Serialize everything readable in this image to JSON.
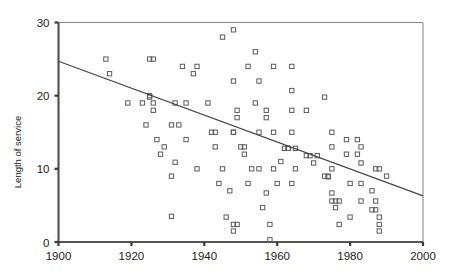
{
  "chart_data": {
    "type": "scatter",
    "title": "",
    "subtitle": "",
    "xlabel": "",
    "ylabel": "Length of service",
    "xlim": [
      1900,
      2000
    ],
    "ylim": [
      0,
      30
    ],
    "xticks": [
      1900,
      1920,
      1940,
      1960,
      1980,
      2000
    ],
    "yticks": [
      0,
      10,
      20,
      30
    ],
    "xtick_labels": [
      "1900",
      "1920",
      "1940",
      "1960",
      "1980",
      "2000"
    ],
    "ytick_labels": [
      "0",
      "10",
      "20",
      "30"
    ],
    "grid": false,
    "legend": null,
    "marker": "open-square",
    "marker_color": "#5b5b5b",
    "series": [
      {
        "name": "Length of service",
        "points": [
          [
            1913,
            25.0
          ],
          [
            1914,
            23.0
          ],
          [
            1919,
            19.0
          ],
          [
            1923,
            19.0
          ],
          [
            1924,
            16.0
          ],
          [
            1925,
            25.0
          ],
          [
            1926,
            25.0
          ],
          [
            1925,
            20.0
          ],
          [
            1925,
            19.8
          ],
          [
            1926,
            19.0
          ],
          [
            1926,
            18.0
          ],
          [
            1927,
            14.0
          ],
          [
            1929,
            13.0
          ],
          [
            1928,
            12.0
          ],
          [
            1931,
            16.0
          ],
          [
            1931,
            9.0
          ],
          [
            1931,
            3.5
          ],
          [
            1932,
            19.0
          ],
          [
            1932,
            10.9
          ],
          [
            1933,
            16.0
          ],
          [
            1934,
            24.0
          ],
          [
            1935,
            19.0
          ],
          [
            1935,
            14.0
          ],
          [
            1937,
            23.0
          ],
          [
            1938,
            24.0
          ],
          [
            1938,
            10.0
          ],
          [
            1941,
            19.0
          ],
          [
            1942,
            15.0
          ],
          [
            1943,
            15.0
          ],
          [
            1943,
            13.0
          ],
          [
            1944,
            8.0
          ],
          [
            1945,
            28.0
          ],
          [
            1945,
            10.0
          ],
          [
            1946,
            3.4
          ],
          [
            1947,
            7.0
          ],
          [
            1948,
            29.0
          ],
          [
            1948,
            22.0
          ],
          [
            1948,
            15.0
          ],
          [
            1948,
            15.0
          ],
          [
            1948,
            2.4
          ],
          [
            1949,
            2.4
          ],
          [
            1948,
            1.5
          ],
          [
            1949,
            18.0
          ],
          [
            1949,
            17.0
          ],
          [
            1950,
            13.0
          ],
          [
            1951,
            13.0
          ],
          [
            1951,
            12.0
          ],
          [
            1952,
            24.0
          ],
          [
            1952,
            8.0
          ],
          [
            1953,
            10.0
          ],
          [
            1954,
            26.0
          ],
          [
            1954,
            19.0
          ],
          [
            1955,
            22.0
          ],
          [
            1955,
            15.0
          ],
          [
            1955,
            10.0
          ],
          [
            1956,
            4.7
          ],
          [
            1957,
            18.0
          ],
          [
            1957,
            17.0
          ],
          [
            1957,
            6.7
          ],
          [
            1958,
            2.4
          ],
          [
            1958,
            0.3
          ],
          [
            1959,
            24.0
          ],
          [
            1959,
            15.0
          ],
          [
            1959,
            10.0
          ],
          [
            1960,
            8.0
          ],
          [
            1962,
            12.8
          ],
          [
            1963,
            12.8
          ],
          [
            1963,
            12.8
          ],
          [
            1961,
            11.0
          ],
          [
            1964,
            24.0
          ],
          [
            1964,
            20.7
          ],
          [
            1964,
            18.0
          ],
          [
            1964,
            15.0
          ],
          [
            1965,
            12.8
          ],
          [
            1965,
            10.0
          ],
          [
            1964,
            8.0
          ],
          [
            1968,
            18.0
          ],
          [
            1968,
            11.8
          ],
          [
            1969,
            11.8
          ],
          [
            1970,
            10.8
          ],
          [
            1971,
            11.8
          ],
          [
            1973,
            19.8
          ],
          [
            1973,
            9.0
          ],
          [
            1974,
            9.0
          ],
          [
            1974,
            8.9
          ],
          [
            1975,
            13.0
          ],
          [
            1975,
            10.0
          ],
          [
            1975,
            6.7
          ],
          [
            1975,
            5.6
          ],
          [
            1976,
            5.6
          ],
          [
            1977,
            5.6
          ],
          [
            1976,
            4.7
          ],
          [
            1977,
            2.4
          ],
          [
            1975,
            15.0
          ],
          [
            1979,
            14.0
          ],
          [
            1979,
            12.0
          ],
          [
            1980,
            8.0
          ],
          [
            1980,
            3.4
          ],
          [
            1982,
            14.0
          ],
          [
            1982,
            12.0
          ],
          [
            1983,
            13.0
          ],
          [
            1983,
            10.8
          ],
          [
            1983,
            8.0
          ],
          [
            1983,
            5.6
          ],
          [
            1986,
            7.0
          ],
          [
            1986,
            4.4
          ],
          [
            1987,
            10.0
          ],
          [
            1988,
            10.0
          ],
          [
            1987,
            5.6
          ],
          [
            1987,
            4.4
          ],
          [
            1988,
            3.4
          ],
          [
            1988,
            2.4
          ],
          [
            1988,
            1.5
          ],
          [
            1990,
            9.0
          ]
        ]
      }
    ],
    "trend_line": {
      "name": "linear-fit",
      "x_start": 1900,
      "y_start": 24.7,
      "x_end": 2000,
      "y_end": 6.3
    }
  }
}
